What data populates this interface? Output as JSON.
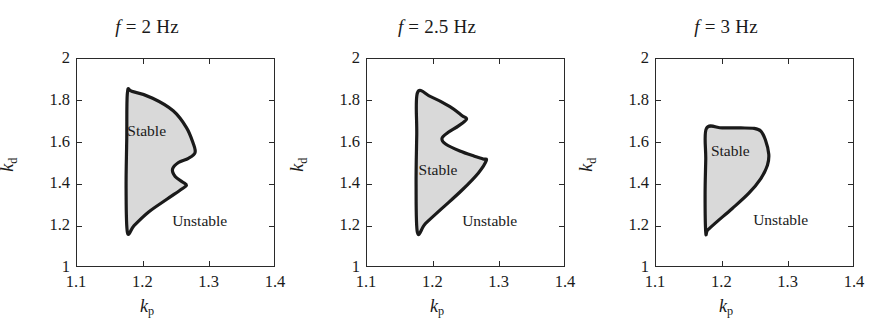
{
  "figure": {
    "background": "#ffffff",
    "region_fill": "#d9d9d9",
    "region_stroke": "#1a1a1a",
    "axis_color": "#2a2a2a"
  },
  "axes": {
    "xlabel_sym": "k",
    "xlabel_sub": "p",
    "ylabel_sym": "k",
    "ylabel_sub": "d",
    "xlim": [
      1.1,
      1.4
    ],
    "ylim": [
      1.0,
      2.0
    ],
    "xticks": [
      1.1,
      1.2,
      1.3,
      1.4
    ],
    "xticklabels": [
      "1.1",
      "1.2",
      "1.3",
      "1.4"
    ],
    "yticks": [
      1.0,
      1.2,
      1.4,
      1.6,
      1.8,
      2.0
    ],
    "yticklabels": [
      "1",
      "1.2",
      "1.4",
      "1.6",
      "1.8",
      "2"
    ],
    "grid": false
  },
  "annotations": {
    "stable": "Stable",
    "unstable": "Unstable"
  },
  "chart_data": {
    "type": "area",
    "xlabel": "k_p",
    "ylabel": "k_d",
    "xlim": [
      1.1,
      1.4
    ],
    "ylim": [
      1.0,
      2.0
    ],
    "grid": false,
    "legend": "none",
    "panels": [
      {
        "title_prefix": "f",
        "title_eq": "=",
        "title_value": "2",
        "title_unit": "Hz",
        "frequency_hz": 2,
        "stable_label": "Stable",
        "unstable_label": "Unstable",
        "stable_label_at": [
          1.205,
          1.655
        ],
        "unstable_label_at": [
          1.285,
          1.225
        ],
        "boundary_kp": [
          1.176,
          1.183,
          1.214,
          1.245,
          1.265,
          1.275,
          1.278,
          1.268,
          1.253,
          1.244,
          1.248,
          1.259,
          1.265,
          1.258,
          1.236,
          1.208,
          1.186,
          1.176,
          1.174,
          1.175
        ],
        "boundary_kd": [
          1.838,
          1.845,
          1.812,
          1.752,
          1.672,
          1.598,
          1.552,
          1.525,
          1.505,
          1.473,
          1.438,
          1.412,
          1.396,
          1.378,
          1.33,
          1.268,
          1.203,
          1.17,
          1.38,
          1.62
        ]
      },
      {
        "title_prefix": "f",
        "title_eq": "=",
        "title_value": "2.5",
        "title_unit": "Hz",
        "frequency_hz": 2.5,
        "stable_label": "Stable",
        "unstable_label": "Unstable",
        "stable_label_at": [
          1.207,
          1.468
        ],
        "unstable_label_at": [
          1.285,
          1.225
        ],
        "boundary_kp": [
          1.176,
          1.196,
          1.225,
          1.243,
          1.25,
          1.238,
          1.222,
          1.213,
          1.219,
          1.24,
          1.262,
          1.275,
          1.28,
          1.268,
          1.243,
          1.213,
          1.188,
          1.176,
          1.174,
          1.175
        ],
        "boundary_kd": [
          1.838,
          1.82,
          1.772,
          1.73,
          1.712,
          1.68,
          1.648,
          1.62,
          1.592,
          1.56,
          1.535,
          1.522,
          1.515,
          1.455,
          1.372,
          1.285,
          1.212,
          1.17,
          1.4,
          1.64
        ]
      },
      {
        "title_prefix": "f",
        "title_eq": "=",
        "title_value": "3",
        "title_unit": "Hz",
        "frequency_hz": 3,
        "stable_label": "Stable",
        "unstable_label": "Unstable",
        "stable_label_at": [
          1.212,
          1.562
        ],
        "unstable_label_at": [
          1.288,
          1.228
        ],
        "boundary_kp": [
          1.176,
          1.2,
          1.228,
          1.248,
          1.258,
          1.265,
          1.27,
          1.268,
          1.258,
          1.24,
          1.215,
          1.192,
          1.178,
          1.175,
          1.174,
          1.175
        ],
        "boundary_kd": [
          1.668,
          1.67,
          1.67,
          1.668,
          1.655,
          1.612,
          1.545,
          1.492,
          1.428,
          1.358,
          1.285,
          1.222,
          1.182,
          1.17,
          1.35,
          1.52
        ]
      }
    ]
  }
}
